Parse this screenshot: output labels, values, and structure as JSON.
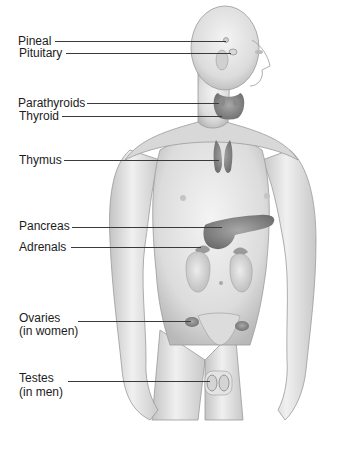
{
  "figure": {
    "labels": [
      {
        "id": "pineal",
        "text": "Pineal"
      },
      {
        "id": "pituitary",
        "text": "Pituitary"
      },
      {
        "id": "parathyroids",
        "text": "Parathyroids"
      },
      {
        "id": "thyroid",
        "text": "Thyroid"
      },
      {
        "id": "thymus",
        "text": "Thymus"
      },
      {
        "id": "pancreas",
        "text": "Pancreas"
      },
      {
        "id": "adrenals",
        "text": "Adrenals"
      },
      {
        "id": "ovaries",
        "text": "Ovaries",
        "note": "(in women)"
      },
      {
        "id": "testes",
        "text": "Testes",
        "note": "(in men)"
      }
    ],
    "colors": {
      "skin_light": "#e8e8e8",
      "skin_shade": "#bdbdbd",
      "organ": "#8c8c8c",
      "organ_dark": "#6e6e6e",
      "leader_line": "#3a3a3a",
      "label_text": "#1c1c1c"
    }
  }
}
